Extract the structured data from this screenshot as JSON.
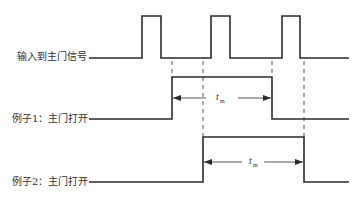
{
  "diagram": {
    "labels": {
      "input_signal": "输入到主门信号",
      "example1": "例子1：主门打开",
      "example2": "例子2：主门打开"
    },
    "duration_label": {
      "symbol": "t",
      "subscript": "m"
    },
    "colors": {
      "line": "#2b2b2b",
      "text": "#333333",
      "background": "#ffffff"
    },
    "signals": {
      "input": {
        "baseline_y": 58,
        "high_y": 16,
        "start_x": 89,
        "end_x": 349,
        "pulses": [
          {
            "rise_x": 142,
            "fall_x": 161
          },
          {
            "rise_x": 211,
            "fall_x": 230
          },
          {
            "rise_x": 282,
            "fall_x": 300
          }
        ]
      },
      "example1": {
        "low_y": 119,
        "high_y": 77,
        "start_x": 89,
        "rise_x": 172,
        "fall_x": 272,
        "end_x": 349,
        "arrow_y": 98
      },
      "example2": {
        "low_y": 182,
        "high_y": 137,
        "start_x": 89,
        "rise_x": 203,
        "fall_x": 304,
        "end_x": 349,
        "arrow_y": 162
      }
    },
    "dashed_guides": [
      {
        "x": 172,
        "y1": 60,
        "y2": 77
      },
      {
        "x": 203,
        "y1": 60,
        "y2": 137
      },
      {
        "x": 272,
        "y1": 60,
        "y2": 77
      },
      {
        "x": 304,
        "y1": 60,
        "y2": 137
      }
    ]
  }
}
